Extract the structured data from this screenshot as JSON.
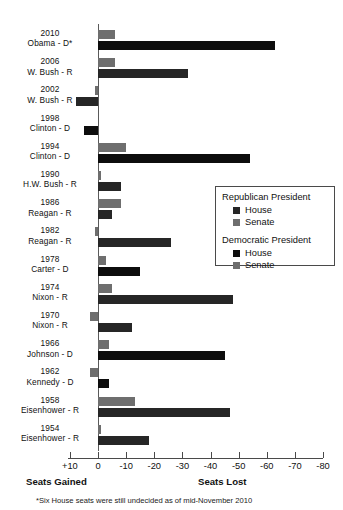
{
  "chart_data": {
    "type": "bar",
    "title": "",
    "orientation": "horizontal",
    "xlabel_left": "Seats Gained",
    "xlabel_right": "Seats Lost",
    "ylabel": "",
    "xlim": [
      10,
      -80
    ],
    "grid": false,
    "axis_ticks": [
      "+10",
      "0",
      "-10",
      "-20",
      "-30",
      "-40",
      "-50",
      "-60",
      "-70",
      "-80"
    ],
    "axis_tick_values": [
      10,
      0,
      -10,
      -20,
      -30,
      -40,
      -50,
      -60,
      -70,
      -80
    ],
    "footnote": "*Six House seats were still undecided as of mid-November 2010",
    "legend": {
      "position": "inside-right",
      "groups": [
        {
          "title": "Republican President",
          "entries": [
            {
              "label": "House",
              "color": "#262626"
            },
            {
              "label": "Senate",
              "color": "#6e6e6e"
            }
          ]
        },
        {
          "title": "Democratic President",
          "entries": [
            {
              "label": "House",
              "color": "#0d0d0d"
            },
            {
              "label": "Senate",
              "color": "#6e6e6e"
            }
          ]
        }
      ]
    },
    "series": [
      {
        "name": "Senate",
        "values": [
          -6,
          -6,
          1,
          0,
          -10,
          -1,
          -8,
          1,
          -3,
          -5,
          3,
          -4,
          3,
          -13,
          -1
        ]
      },
      {
        "name": "House",
        "values": [
          -63,
          -32,
          8,
          5,
          -54,
          -8,
          -5,
          -26,
          -15,
          -48,
          -12,
          -45,
          -4,
          -47,
          -18
        ]
      }
    ],
    "categories": [
      {
        "year": "2010",
        "president": "Obama - D*",
        "party": "D",
        "senate": -6,
        "house": -63
      },
      {
        "year": "2006",
        "president": "W. Bush - R",
        "party": "R",
        "senate": -6,
        "house": -32
      },
      {
        "year": "2002",
        "president": "W. Bush - R",
        "party": "R",
        "senate": 1,
        "house": 8
      },
      {
        "year": "1998",
        "president": "Clinton - D",
        "party": "D",
        "senate": 0,
        "house": 5
      },
      {
        "year": "1994",
        "president": "Clinton - D",
        "party": "D",
        "senate": -10,
        "house": -54
      },
      {
        "year": "1990",
        "president": "H.W. Bush - R",
        "party": "R",
        "senate": -1,
        "house": -8
      },
      {
        "year": "1986",
        "president": "Reagan - R",
        "party": "R",
        "senate": -8,
        "house": -5
      },
      {
        "year": "1982",
        "president": "Reagan - R",
        "party": "R",
        "senate": 1,
        "house": -26
      },
      {
        "year": "1978",
        "president": "Carter - D",
        "party": "D",
        "senate": -3,
        "house": -15
      },
      {
        "year": "1974",
        "president": "Nixon - R",
        "party": "R",
        "senate": -5,
        "house": -48
      },
      {
        "year": "1970",
        "president": "Nixon - R",
        "party": "R",
        "senate": 3,
        "house": -12
      },
      {
        "year": "1966",
        "president": "Johnson - D",
        "party": "D",
        "senate": -4,
        "house": -45
      },
      {
        "year": "1962",
        "president": "Kennedy - D",
        "party": "D",
        "senate": 3,
        "house": -4
      },
      {
        "year": "1958",
        "president": "Eisenhower - R",
        "party": "R",
        "senate": -13,
        "house": -47
      },
      {
        "year": "1954",
        "president": "Eisenhower - R",
        "party": "R",
        "senate": -1,
        "house": -18
      }
    ]
  }
}
